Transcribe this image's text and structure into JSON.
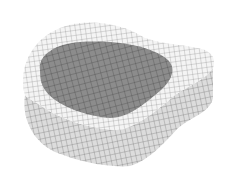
{
  "figure": {
    "colors": {
      "background": "#ffffff",
      "cortical_shell": "#f2f2f2",
      "cancellous_core": "#8a8a8a",
      "side_wall": "#d9d9d9",
      "mesh_line": "#555555"
    }
  }
}
